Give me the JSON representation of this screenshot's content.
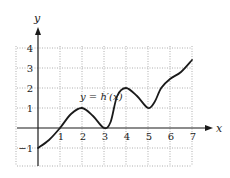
{
  "chart_data": {
    "type": "line",
    "title": "",
    "xlabel": "x",
    "ylabel": "y",
    "xlim": [
      -1,
      7
    ],
    "ylim": [
      -1.9,
      4
    ],
    "grid": true,
    "grid_style": "dotted",
    "x_ticks": [
      1,
      2,
      3,
      4,
      5,
      6,
      7
    ],
    "x_tick_labels": [
      "1",
      "2",
      "3",
      "4",
      "5",
      "6",
      "7"
    ],
    "y_ticks": [
      -1,
      1,
      2,
      3,
      4
    ],
    "y_tick_labels": [
      "−1",
      "1",
      "2",
      "3",
      "4"
    ],
    "legend": null,
    "annotations": [
      {
        "text": "y = h′(x)",
        "x": 2.0,
        "y": 1.4
      }
    ],
    "series": [
      {
        "name": "y = h′(x)",
        "color": "#1a1a1a",
        "points": [
          [
            0,
            -1
          ],
          [
            0.5,
            -0.6
          ],
          [
            1,
            0
          ],
          [
            1.5,
            0.7
          ],
          [
            2,
            1
          ],
          [
            2.5,
            0.6
          ],
          [
            3,
            0
          ],
          [
            3.3,
            0.3
          ],
          [
            3.6,
            1.6
          ],
          [
            4,
            2
          ],
          [
            4.5,
            1.6
          ],
          [
            5,
            1.0
          ],
          [
            5.3,
            1.3
          ],
          [
            5.6,
            2.0
          ],
          [
            6,
            2.45
          ],
          [
            6.5,
            2.8
          ],
          [
            7,
            3.4
          ]
        ]
      }
    ]
  },
  "labels": {
    "x_axis": "x",
    "y_axis": "y",
    "curve": "y = h′(x)"
  },
  "colors": {
    "axis": "#1a1a1a",
    "grid": "#9a9a9a",
    "curve": "#1a1a1a"
  }
}
